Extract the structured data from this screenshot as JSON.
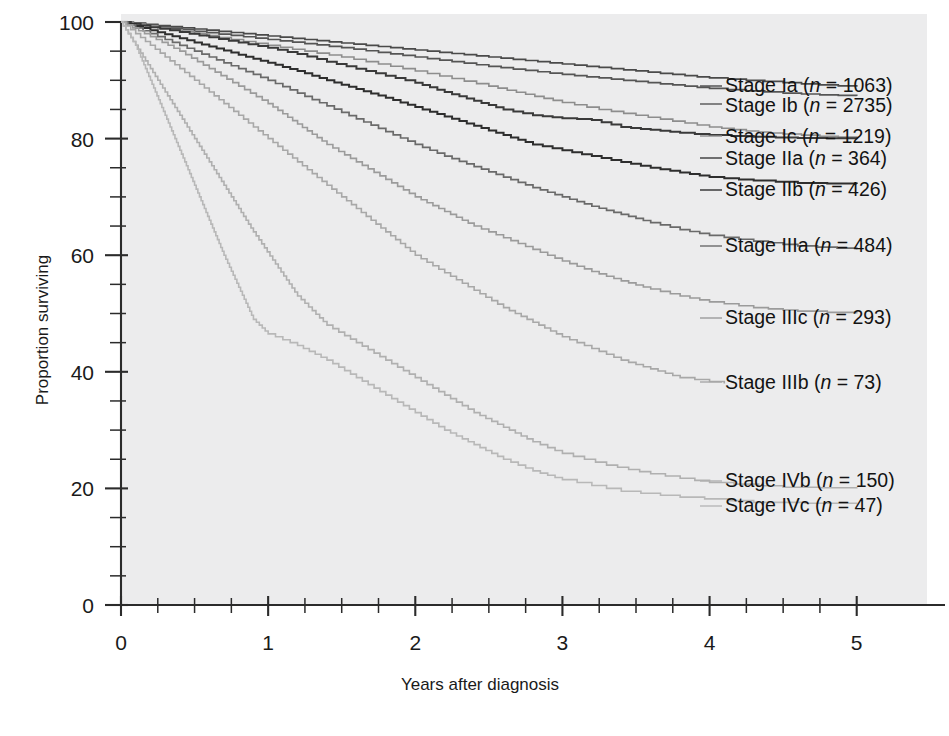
{
  "chart_data": {
    "type": "line",
    "subtype": "kaplan-meier-survival",
    "title": "",
    "xlabel": "Years after diagnosis",
    "ylabel": "Proportion surviving",
    "xlim": [
      0,
      5.6
    ],
    "ylim": [
      0,
      100
    ],
    "x_major_ticks": [
      0,
      1,
      2,
      3,
      4,
      5
    ],
    "x_tick_labels": [
      "0",
      "1",
      "2",
      "3",
      "4",
      "5"
    ],
    "x_minor_step": 0.25,
    "y_major_ticks": [
      0,
      20,
      40,
      60,
      80,
      100
    ],
    "y_tick_labels": [
      "0",
      "20",
      "40",
      "60",
      "80",
      "100"
    ],
    "y_minor_step": 5,
    "grid": false,
    "legend_position": "right-inline-labels",
    "x_unit": "years",
    "y_unit": "percent",
    "series": [
      {
        "name": "Stage Ia",
        "label": "Stage Ia (n = 1063)",
        "stage": "Ia",
        "n": 1063,
        "color": "#4a4a4a",
        "width": 1.7,
        "label_x": 725,
        "label_y": 92,
        "leader": [
          [
            700,
            86
          ],
          [
            722,
            86
          ]
        ],
        "x": [
          0,
          0.25,
          0.5,
          0.75,
          1.0,
          1.25,
          1.5,
          1.75,
          2.0,
          2.25,
          2.5,
          2.75,
          3.0,
          3.25,
          3.5,
          3.75,
          4.0,
          4.25,
          4.5,
          4.75,
          5.0
        ],
        "y": [
          100,
          99.4,
          98.8,
          98.2,
          97.6,
          97.0,
          96.4,
          95.8,
          95.2,
          94.6,
          94.0,
          93.4,
          92.8,
          92.2,
          91.6,
          91.0,
          90.4,
          90.0,
          89.6,
          89.2,
          88.9
        ]
      },
      {
        "name": "Stage Ib",
        "label": "Stage Ib (n = 2735)",
        "stage": "Ib",
        "n": 2735,
        "color": "#555555",
        "width": 1.7,
        "label_x": 725,
        "label_y": 112,
        "leader": [
          [
            700,
            104
          ],
          [
            722,
            104
          ]
        ],
        "x": [
          0,
          0.25,
          0.5,
          0.75,
          1.0,
          1.25,
          1.5,
          1.75,
          2.0,
          2.25,
          2.5,
          2.75,
          3.0,
          3.25,
          3.5,
          3.75,
          4.0,
          4.25,
          4.5,
          4.75,
          5.0
        ],
        "y": [
          100,
          99.2,
          98.4,
          97.7,
          97.0,
          96.3,
          95.6,
          94.8,
          94.0,
          93.2,
          92.4,
          91.7,
          91.0,
          90.4,
          89.8,
          89.2,
          88.6,
          88.2,
          87.8,
          87.5,
          87.3
        ]
      },
      {
        "name": "Stage Ic",
        "label": "Stage Ic (n = 1219)",
        "stage": "Ic",
        "n": 1219,
        "color": "#8d8d8d",
        "width": 1.6,
        "label_x": 725,
        "label_y": 143,
        "leader": [
          [
            700,
            136
          ],
          [
            722,
            136
          ]
        ],
        "x": [
          0,
          0.25,
          0.5,
          0.75,
          1.0,
          1.25,
          1.5,
          1.75,
          2.0,
          2.25,
          2.5,
          2.75,
          3.0,
          3.25,
          3.5,
          3.75,
          4.0,
          4.25,
          4.5,
          4.75,
          5.0
        ],
        "y": [
          100,
          99.0,
          98.0,
          97.0,
          96.0,
          95.0,
          94.0,
          92.8,
          91.6,
          90.3,
          89.0,
          87.6,
          86.2,
          85.0,
          84.0,
          83.0,
          82.0,
          81.3,
          80.8,
          80.4,
          80.1
        ]
      },
      {
        "name": "Stage IIa",
        "label": "Stage IIa (n = 364)",
        "stage": "IIa",
        "n": 364,
        "color": "#3a3a3a",
        "width": 2.0,
        "label_x": 725,
        "label_y": 165,
        "leader": [
          [
            700,
            158
          ],
          [
            722,
            158
          ]
        ],
        "x": [
          0,
          0.2,
          0.4,
          0.6,
          0.8,
          1.0,
          1.2,
          1.4,
          1.6,
          1.8,
          2.0,
          2.2,
          2.4,
          2.6,
          2.8,
          3.0,
          3.2,
          3.4,
          3.6,
          3.8,
          4.0,
          4.3,
          4.6,
          5.0
        ],
        "y": [
          100,
          99.1,
          98.3,
          97.4,
          96.5,
          95.6,
          94.5,
          93.2,
          92.0,
          90.8,
          89.6,
          88.0,
          86.5,
          85.0,
          84.0,
          83.5,
          83.2,
          82.0,
          81.5,
          81.0,
          80.6,
          80.3,
          80.1,
          80.0
        ]
      },
      {
        "name": "Stage IIb",
        "label": "Stage IIb (n = 426)",
        "stage": "IIb",
        "n": 426,
        "color": "#2e2e2e",
        "width": 2.0,
        "label_x": 725,
        "label_y": 196,
        "leader": [
          [
            700,
            190
          ],
          [
            722,
            190
          ]
        ],
        "x": [
          0,
          0.2,
          0.4,
          0.6,
          0.8,
          1.0,
          1.2,
          1.4,
          1.6,
          1.8,
          2.0,
          2.2,
          2.4,
          2.6,
          2.8,
          3.0,
          3.2,
          3.4,
          3.6,
          3.8,
          4.0,
          4.3,
          4.6,
          5.0
        ],
        "y": [
          100,
          98.6,
          97.2,
          95.8,
          94.4,
          93.0,
          91.6,
          90.0,
          88.5,
          87.0,
          85.4,
          83.8,
          82.2,
          80.6,
          79.0,
          78.0,
          77.0,
          76.0,
          75.0,
          74.2,
          73.4,
          72.8,
          72.4,
          72.2
        ]
      },
      {
        "name": "Stage IIIa",
        "label": "Stage IIIa (n = 484)",
        "stage": "IIIa",
        "n": 484,
        "color": "#6a6a6a",
        "width": 1.7,
        "label_x": 725,
        "label_y": 252,
        "leader": [
          [
            700,
            246
          ],
          [
            722,
            246
          ]
        ],
        "x": [
          0,
          0.2,
          0.4,
          0.6,
          0.8,
          1.0,
          1.2,
          1.4,
          1.6,
          1.8,
          2.0,
          2.2,
          2.4,
          2.6,
          2.8,
          3.0,
          3.2,
          3.4,
          3.6,
          3.8,
          4.0,
          4.3,
          4.6,
          5.0
        ],
        "y": [
          100,
          98.0,
          96.0,
          94.0,
          92.0,
          90.0,
          87.8,
          85.6,
          83.4,
          81.2,
          79.0,
          77.0,
          75.2,
          73.4,
          71.6,
          70.0,
          68.4,
          67.0,
          65.6,
          64.4,
          63.4,
          62.4,
          61.6,
          61.0
        ]
      },
      {
        "name": "Stage IIIc",
        "label": "Stage IIIc (n = 293)",
        "stage": "IIIc",
        "n": 293,
        "color": "#9b9b9b",
        "width": 1.6,
        "label_x": 725,
        "label_y": 324,
        "leader": [
          [
            700,
            318
          ],
          [
            722,
            318
          ]
        ],
        "x": [
          0,
          0.2,
          0.4,
          0.6,
          0.8,
          1.0,
          1.2,
          1.4,
          1.6,
          1.8,
          2.0,
          2.2,
          2.4,
          2.6,
          2.8,
          3.0,
          3.2,
          3.4,
          3.6,
          3.8,
          4.0,
          4.3,
          4.6,
          5.0
        ],
        "y": [
          100,
          97.5,
          95.0,
          92.0,
          89.0,
          86.0,
          82.5,
          79.0,
          76.0,
          73.0,
          70.0,
          67.5,
          65.0,
          63.0,
          61.0,
          59.0,
          57.2,
          55.6,
          54.2,
          53.0,
          52.0,
          51.0,
          50.4,
          50.0
        ]
      },
      {
        "name": "Stage IIIb",
        "label": "Stage IIIb (n = 73)",
        "stage": "IIIb",
        "n": 73,
        "color": "#a8a8a8",
        "width": 1.6,
        "label_x": 725,
        "label_y": 389,
        "leader": [
          [
            700,
            382
          ],
          [
            722,
            382
          ]
        ],
        "x": [
          0,
          0.2,
          0.4,
          0.6,
          0.8,
          1.0,
          1.2,
          1.4,
          1.6,
          1.8,
          2.0,
          2.2,
          2.4,
          2.6,
          2.8,
          3.0,
          3.2,
          3.4,
          3.6,
          3.8,
          4.1
        ],
        "y": [
          100,
          96.0,
          92.0,
          88.0,
          84.0,
          80.0,
          76.0,
          72.0,
          68.0,
          64.0,
          60.0,
          57.0,
          54.0,
          51.0,
          48.5,
          46.0,
          44.0,
          42.0,
          40.5,
          39.0,
          38.0
        ]
      },
      {
        "name": "Stage IVb",
        "label": "Stage IVb (n = 150)",
        "stage": "IVb",
        "n": 150,
        "color": "#b0b0b0",
        "width": 1.6,
        "label_x": 725,
        "label_y": 487,
        "leader": [
          [
            700,
            481
          ],
          [
            722,
            481
          ]
        ],
        "x": [
          0,
          0.15,
          0.3,
          0.45,
          0.6,
          0.75,
          0.9,
          1.05,
          1.2,
          1.4,
          1.6,
          1.8,
          2.0,
          2.2,
          2.4,
          2.6,
          2.8,
          3.0,
          3.3,
          3.6,
          4.0,
          4.5,
          5.0
        ],
        "y": [
          100,
          94.0,
          88.0,
          82.0,
          76.0,
          70.0,
          64.0,
          58.5,
          53.0,
          48.0,
          45.0,
          42.0,
          39.0,
          36.0,
          33.0,
          30.5,
          28.0,
          26.0,
          24.0,
          22.5,
          21.0,
          20.2,
          20.0
        ]
      },
      {
        "name": "Stage IVc",
        "label": "Stage IVc (n = 47)",
        "stage": "IVc",
        "n": 47,
        "color": "#b8b8b8",
        "width": 1.6,
        "label_x": 725,
        "label_y": 512,
        "leader": [
          [
            700,
            506
          ],
          [
            722,
            506
          ]
        ],
        "x": [
          0,
          0.1,
          0.2,
          0.3,
          0.4,
          0.5,
          0.6,
          0.7,
          0.8,
          0.9,
          1.0,
          1.2,
          1.4,
          1.6,
          1.8,
          2.0,
          2.2,
          2.4,
          2.6,
          2.8,
          3.0,
          3.4,
          3.8,
          4.3,
          5.0
        ],
        "y": [
          100,
          96.0,
          90.0,
          84.0,
          78.0,
          72.0,
          66.0,
          60.0,
          54.5,
          49.0,
          46.5,
          44.5,
          42.0,
          39.0,
          36.0,
          33.0,
          30.0,
          27.5,
          25.0,
          23.0,
          21.5,
          19.5,
          18.5,
          17.6,
          17.3
        ]
      }
    ]
  },
  "axes": {
    "y_title": "Proportion surviving",
    "x_title": "Years after diagnosis"
  },
  "colors": {
    "plot_background": "#ececed",
    "axis": "#2b2b2b",
    "text": "#131313",
    "page_background": "#ffffff"
  }
}
